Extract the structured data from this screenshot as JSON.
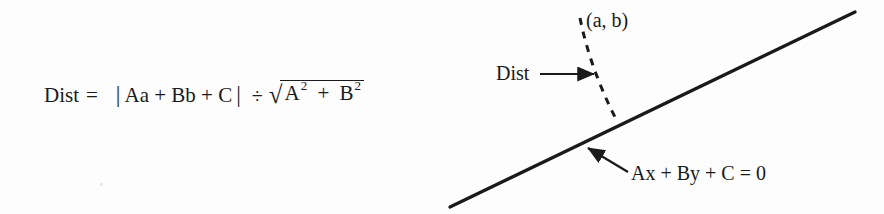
{
  "figure": {
    "background_color": "#fdfdfd",
    "ink_color": "#1a1a1a",
    "width": 884,
    "height": 214
  },
  "formula": {
    "lhs": "Dist",
    "equals": "=",
    "abs_open": "|",
    "numerator": "Aa + Bb + C",
    "abs_close": "|",
    "divide": "÷",
    "radical_sign": "√",
    "radicand_first_base": "A",
    "radicand_first_exponent": "2",
    "radicand_plus": "+",
    "radicand_second_base": "B",
    "radicand_second_exponent": "2",
    "plain_text": "Dist =  | Aa + Bb + C | ÷ √(A² + B²)"
  },
  "diagram": {
    "point_label": "(a, b)",
    "distance_label": "Dist",
    "line_equation_label": "Ax + By + C = 0",
    "solid_line": {
      "name": "line-Ax-By-C-0",
      "x1": 450,
      "y1": 207,
      "x2": 855,
      "y2": 12,
      "stroke_width": 3.2,
      "color": "#1a1a1a"
    },
    "dashed_line": {
      "name": "perpendicular-distance-segment",
      "x1": 580,
      "y1": 18,
      "x2": 617,
      "y2": 121,
      "stroke_width": 3,
      "dash": "7 7",
      "color": "#1a1a1a"
    },
    "dist_arrow": {
      "name": "dist-pointer-arrow",
      "x1": 540,
      "y1": 74,
      "x2": 597,
      "y2": 74,
      "stroke_width": 2.2,
      "color": "#1a1a1a"
    },
    "line_arrow": {
      "name": "line-equation-pointer-arrow",
      "x1": 628,
      "y1": 172,
      "x2": 585,
      "y2": 146,
      "stroke_width": 2.2,
      "color": "#1a1a1a"
    }
  }
}
